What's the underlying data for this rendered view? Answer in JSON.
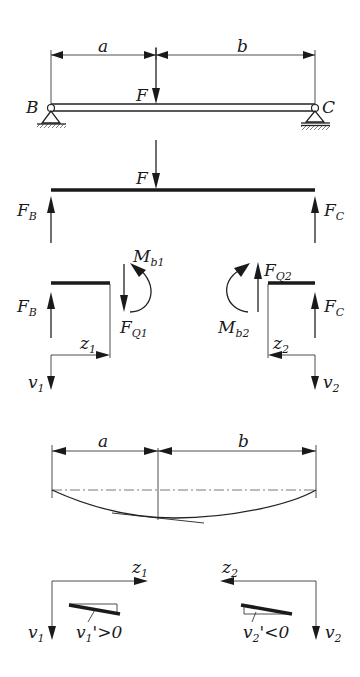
{
  "figure": {
    "panel_beam": {
      "dim_a": "a",
      "dim_b": "b",
      "load": "F",
      "support_left": "B",
      "support_right": "C"
    },
    "panel_fbd": {
      "load": "F",
      "reaction_left": {
        "main": "F",
        "sub": "B"
      },
      "reaction_right": {
        "main": "F",
        "sub": "C"
      }
    },
    "panel_sections": {
      "left": {
        "reaction": {
          "main": "F",
          "sub": "B"
        },
        "moment": {
          "main": "M",
          "sub": "b1"
        },
        "shear": {
          "main": "F",
          "sub": "Q1"
        },
        "axis_z": {
          "main": "z",
          "sub": "1"
        },
        "axis_v": {
          "main": "v",
          "sub": "1"
        }
      },
      "right": {
        "reaction": {
          "main": "F",
          "sub": "C"
        },
        "moment": {
          "main": "M",
          "sub": "b2"
        },
        "shear": {
          "main": "F",
          "sub": "Q2"
        },
        "axis_z": {
          "main": "z",
          "sub": "2"
        },
        "axis_v": {
          "main": "v",
          "sub": "2"
        }
      }
    },
    "panel_deflection": {
      "dim_a": "a",
      "dim_b": "b"
    },
    "panel_slopes": {
      "left": {
        "axis_z": {
          "main": "z",
          "sub": "1"
        },
        "axis_v": {
          "main": "v",
          "sub": "1"
        },
        "slope": {
          "main": "v",
          "sub": "1",
          "rel": "'>0"
        }
      },
      "right": {
        "axis_z": {
          "main": "z",
          "sub": "2"
        },
        "axis_v": {
          "main": "v",
          "sub": "2"
        },
        "slope": {
          "main": "v",
          "sub": "2",
          "rel": "'<0"
        }
      }
    }
  }
}
